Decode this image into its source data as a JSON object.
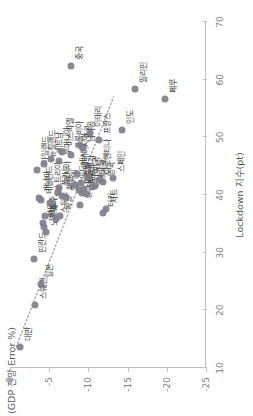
{
  "chart_data": {
    "type": "scatter",
    "title": "",
    "xlabel": "Lockdown 지수(pt)",
    "ylabel": "(GDP 전망 Error %)",
    "xlim": [
      10,
      70
    ],
    "ylim": [
      -25,
      0
    ],
    "xticks": [
      10,
      20,
      30,
      40,
      50,
      60,
      70
    ],
    "yticks": [
      0,
      -5,
      -10,
      -15,
      -20,
      -25
    ],
    "grid": false,
    "legend": false,
    "marker_color": "#7f7f8c",
    "trendline": {
      "style": "dotted",
      "color": "#a6a6a6",
      "x": [
        13,
        57
      ],
      "y": [
        -0.6,
        -13.2
      ]
    },
    "points": [
      {
        "label": "대만",
        "x": 13.6,
        "y": -1.3
      },
      {
        "label": "스웨덴",
        "x": 21.0,
        "y": -3.2
      },
      {
        "label": "일본",
        "x": 24.5,
        "y": -4.0
      },
      {
        "label": "핀란드",
        "x": 28.9,
        "y": -3.1
      },
      {
        "label": "노르웨이",
        "x": 33.5,
        "y": -4.6
      },
      {
        "label": "덴마크",
        "x": 34.4,
        "y": -4.4
      },
      {
        "label": "한국",
        "x": 35.1,
        "y": -4.2
      },
      {
        "label": "스위스",
        "x": 35.8,
        "y": -5.9
      },
      {
        "label": "독일",
        "x": 36.3,
        "y": -6.4
      },
      {
        "label": "호주",
        "x": 36.4,
        "y": -4.5
      },
      {
        "label": "터키",
        "x": 36.8,
        "y": -11.8
      },
      {
        "label": "차트",
        "x": 37.6,
        "y": -12.3
      },
      {
        "label": "싱가포르",
        "x": 38.2,
        "y": -8.9
      },
      {
        "label": "오스트리아",
        "x": 38.6,
        "y": -5.1
      },
      {
        "label": "네덜란드",
        "x": 39.1,
        "y": -4.0
      },
      {
        "label": "캐나다",
        "x": 39.4,
        "y": -3.7
      },
      {
        "label": "벨기에",
        "x": 39.6,
        "y": -7.1
      },
      {
        "label": "체코",
        "x": 39.8,
        "y": -6.6
      },
      {
        "label": "헝가리",
        "x": 40.1,
        "y": -9.8
      },
      {
        "label": "태국",
        "x": 40.4,
        "y": -9.2
      },
      {
        "label": "폴란드",
        "x": 40.6,
        "y": -6.1
      },
      {
        "label": "그리스",
        "x": 40.8,
        "y": -8.8
      },
      {
        "label": "포르투갈",
        "x": 41.0,
        "y": -9.4
      },
      {
        "label": "러시아",
        "x": 41.2,
        "y": -6.2
      },
      {
        "label": "브라질",
        "x": 41.4,
        "y": -10.5
      },
      {
        "label": "멕시코",
        "x": 41.6,
        "y": -10.9
      },
      {
        "label": "인도네시아",
        "x": 41.8,
        "y": -8.3
      },
      {
        "label": "칠레",
        "x": 42.0,
        "y": -9.1
      },
      {
        "label": "영국",
        "x": 42.3,
        "y": -11.8
      },
      {
        "label": "아르헨티나",
        "x": 42.6,
        "y": -11.4
      },
      {
        "label": "스페인",
        "x": 42.9,
        "y": -13.2
      },
      {
        "label": "미국",
        "x": 43.2,
        "y": -9.9
      },
      {
        "label": "말레이시아",
        "x": 43.7,
        "y": -8.6
      },
      {
        "label": "아일랜드",
        "x": 44.3,
        "y": -3.5
      },
      {
        "label": "뉴질랜드",
        "x": 45.4,
        "y": -4.3
      },
      {
        "label": "루마니아",
        "x": 45.9,
        "y": -6.2
      },
      {
        "label": "베트남",
        "x": 46.3,
        "y": -5.2
      },
      {
        "label": "콜롬비아",
        "x": 46.9,
        "y": -7.8
      },
      {
        "label": "이스라엘",
        "x": 47.4,
        "y": -6.6
      },
      {
        "label": "남아공",
        "x": 48.1,
        "y": -9.3
      },
      {
        "label": "홍콩",
        "x": 48.6,
        "y": -8.9
      },
      {
        "label": "프랑스",
        "x": 49.6,
        "y": -11.3
      },
      {
        "label": "이태리",
        "x": 50.8,
        "y": -10.2
      },
      {
        "label": "인도",
        "x": 51.3,
        "y": -14.3
      },
      {
        "label": "페루",
        "x": 56.7,
        "y": -19.8
      },
      {
        "label": "필리핀",
        "x": 58.4,
        "y": -15.9
      },
      {
        "label": "중국",
        "x": 62.4,
        "y": -7.8
      }
    ]
  }
}
